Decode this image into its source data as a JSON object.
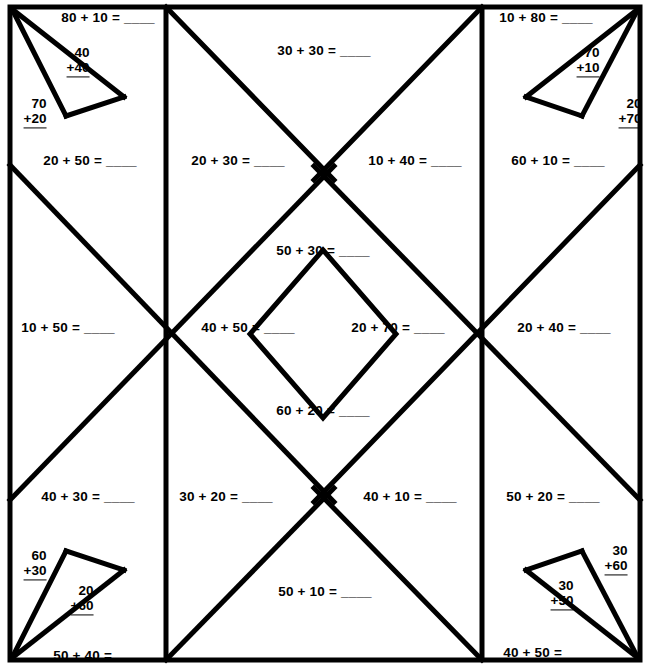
{
  "worksheet": {
    "title": "Addition Mystery Picture Grid",
    "colors": {
      "ink": "#000000",
      "paper": "#ffffff"
    },
    "geometry": {
      "width": 648,
      "height": 668,
      "frame": {
        "left": 10,
        "top": 7,
        "right": 640,
        "bottom": 660
      },
      "vertical_dividers": [
        166,
        482
      ],
      "x_crossings_y": 334,
      "edge_vertices_y": [
        165,
        500
      ],
      "inner_diamond": {
        "left": 250,
        "right": 396,
        "top": 250,
        "bottom": 418,
        "cx": 323,
        "cy": 334
      }
    },
    "problems": {
      "horizontal": [
        {
          "id": "tl-top",
          "text": "80 + 10 = ____",
          "x": 108,
          "y": 17
        },
        {
          "id": "top-center",
          "text": "30 + 30 = ____",
          "x": 324,
          "y": 50
        },
        {
          "id": "tr-top",
          "text": "10 + 80 = ____",
          "x": 546,
          "y": 17
        },
        {
          "id": "row1-col1",
          "text": "20 + 50 = ____",
          "x": 90,
          "y": 160
        },
        {
          "id": "row1-col2",
          "text": "20 + 30 = ____",
          "x": 238,
          "y": 160
        },
        {
          "id": "row1-col3",
          "text": "10 + 40 = ____",
          "x": 415,
          "y": 160
        },
        {
          "id": "row1-col4",
          "text": "60 + 10 = ____",
          "x": 558,
          "y": 160
        },
        {
          "id": "diamond-top",
          "text": "50 + 30 = ____",
          "x": 323,
          "y": 250
        },
        {
          "id": "row2-col1",
          "text": "10 + 50 = ____",
          "x": 68,
          "y": 327
        },
        {
          "id": "diamond-left",
          "text": "40 + 50 = ____",
          "x": 248,
          "y": 327
        },
        {
          "id": "diamond-right",
          "text": "20 + 70 = ____",
          "x": 398,
          "y": 327
        },
        {
          "id": "row2-col4",
          "text": "20 + 40 = ____",
          "x": 564,
          "y": 327
        },
        {
          "id": "diamond-bot",
          "text": "60 + 20 = ____",
          "x": 323,
          "y": 410
        },
        {
          "id": "row3-col1",
          "text": "40 + 30 = ____",
          "x": 88,
          "y": 496
        },
        {
          "id": "row3-col2",
          "text": "30 + 20 = ____",
          "x": 226,
          "y": 496
        },
        {
          "id": "row3-col3",
          "text": "40 + 10 = ____",
          "x": 410,
          "y": 496
        },
        {
          "id": "row3-col4",
          "text": "50 + 20 = ____",
          "x": 553,
          "y": 496
        },
        {
          "id": "bottom-center",
          "text": "50 + 10 = ____",
          "x": 325,
          "y": 591
        },
        {
          "id": "bl-bottom",
          "text": "50 + 40 = ____",
          "x": 100,
          "y": 655
        },
        {
          "id": "br-bottom",
          "text": "40 + 50 = ____",
          "x": 550,
          "y": 652
        }
      ],
      "stacked": [
        {
          "id": "tl-inner",
          "top": "40",
          "bot": "+40",
          "x": 78,
          "y": 62
        },
        {
          "id": "tl-outer",
          "top": "70",
          "bot": "+20",
          "x": 35,
          "y": 113
        },
        {
          "id": "tr-inner",
          "top": "70",
          "bot": "+10",
          "x": 588,
          "y": 62
        },
        {
          "id": "tr-outer",
          "top": "20",
          "bot": "+70",
          "x": 630,
          "y": 113
        },
        {
          "id": "bl-outer",
          "top": "60",
          "bot": "+30",
          "x": 35,
          "y": 565
        },
        {
          "id": "bl-inner",
          "top": "20",
          "bot": "+60",
          "x": 82,
          "y": 600
        },
        {
          "id": "br-outer",
          "top": "30",
          "bot": "+60",
          "x": 616,
          "y": 560
        },
        {
          "id": "br-inner",
          "top": "30",
          "bot": "+50",
          "x": 562,
          "y": 595
        }
      ]
    }
  }
}
